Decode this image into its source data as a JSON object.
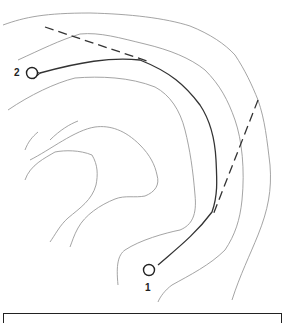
{
  "diagram": {
    "type": "topographic-route-map",
    "colors": {
      "contour": "#9a9a9a",
      "route": "#333333",
      "dashed": "#333333",
      "marker": "#222222",
      "background": "#ffffff"
    },
    "points": [
      {
        "id": "1",
        "label": "1",
        "role": "start",
        "cx": 149,
        "cy": 270
      },
      {
        "id": "2",
        "label": "2",
        "role": "end",
        "cx": 32,
        "cy": 73
      }
    ],
    "route": {
      "from": "1",
      "to": "2",
      "style": "solid-arrow"
    },
    "dashed_lines": [
      {
        "name": "upper-dashed-line"
      },
      {
        "name": "right-dashed-line"
      }
    ],
    "contour_count": 9
  }
}
